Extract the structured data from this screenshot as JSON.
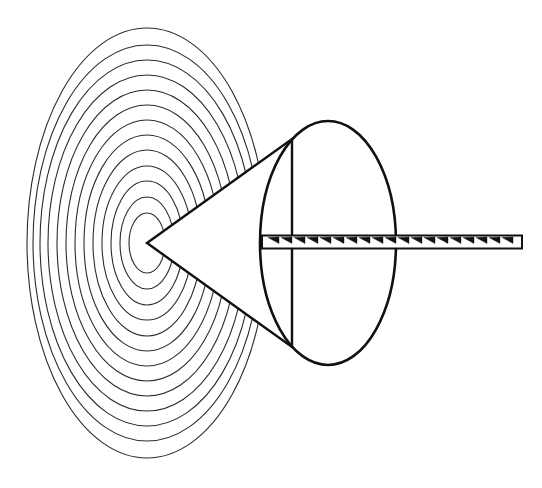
{
  "figure": {
    "kind": "line-diagram",
    "canvas": {
      "width": 542,
      "height": 488
    },
    "background_color": "#ffffff",
    "stroke_color": "#1a1a1a",
    "fill_color": "#ffffff",
    "labels": [],
    "annotations": []
  },
  "wavefronts": {
    "name": "concentric-wavefront-ellipses",
    "center": {
      "x": 147,
      "y": 243
    },
    "count": 13,
    "stroke_color": "#2b2b2b",
    "stroke_width": 1.1,
    "fill": "none",
    "ellipses": [
      {
        "rx": 18,
        "ry": 30
      },
      {
        "rx": 27,
        "ry": 46
      },
      {
        "rx": 36,
        "ry": 62
      },
      {
        "rx": 45,
        "ry": 77
      },
      {
        "rx": 54,
        "ry": 93
      },
      {
        "rx": 63,
        "ry": 108
      },
      {
        "rx": 72,
        "ry": 123
      },
      {
        "rx": 81,
        "ry": 138
      },
      {
        "rx": 90,
        "ry": 153
      },
      {
        "rx": 99,
        "ry": 168
      },
      {
        "rx": 107,
        "ry": 183
      },
      {
        "rx": 114,
        "ry": 198
      },
      {
        "rx": 120,
        "ry": 215
      }
    ]
  },
  "cone": {
    "name": "mach-cone",
    "apex": {
      "x": 147,
      "y": 243
    },
    "upper_edge_end": {
      "x": 292,
      "y": 139
    },
    "lower_edge_end": {
      "x": 292,
      "y": 347
    },
    "fill": "#ffffff",
    "stroke_color": "#111111",
    "stroke_width": 2.4
  },
  "cone_base": {
    "name": "cone-base-ellipse",
    "center": {
      "x": 328,
      "y": 243
    },
    "rx": 68,
    "ry": 122,
    "fill": "none",
    "stroke_color": "#111111",
    "stroke_width": 2.6
  },
  "axis_rod": {
    "name": "hatched-axis-rod",
    "x_start": 262,
    "x_end": 522,
    "y_center": 242,
    "thickness": 13,
    "stroke_color": "#111111",
    "stroke_width": 2.0,
    "hatch": {
      "style": "diagonal-tick-marks",
      "count": 20,
      "spacing": 13,
      "stroke_color": "#111111",
      "stroke_width": 1.4
    }
  }
}
